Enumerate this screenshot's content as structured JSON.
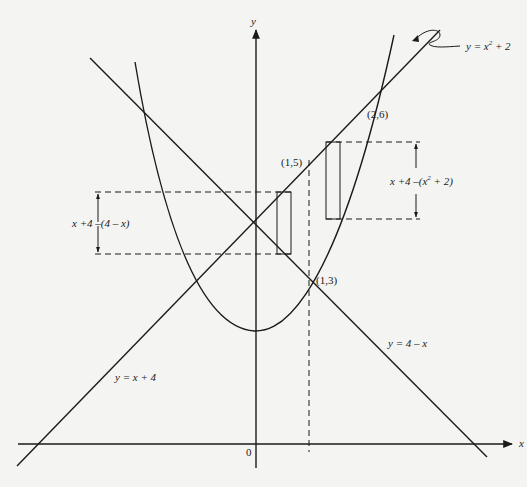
{
  "figure": {
    "axes": {
      "x_label": "x",
      "y_label": "y",
      "origin_label": "0"
    },
    "curves": [
      {
        "name": "parabola",
        "label": "y = x² + 2",
        "label_pre": "y = x",
        "label_sup": "2",
        "label_post": " + 2"
      },
      {
        "name": "line-rising",
        "label": "y = x + 4"
      },
      {
        "name": "line-falling",
        "label": "y = 4 – x"
      }
    ],
    "points": [
      {
        "label": "(1,5)"
      },
      {
        "label": "(1,3)"
      },
      {
        "label": "(2,6)"
      }
    ],
    "heights": [
      {
        "label": "x +4 –(4 – x)"
      },
      {
        "label_pre": "x +4 –(x",
        "label_sup": "2",
        "label_post": " + 2)"
      }
    ],
    "colors": {
      "ink": "#1a1a1a",
      "background": "#f4f4f2"
    }
  }
}
